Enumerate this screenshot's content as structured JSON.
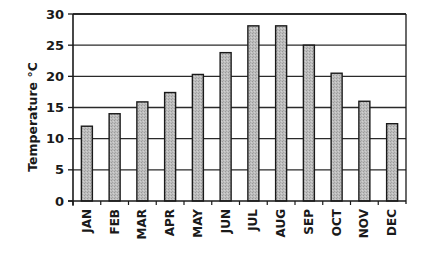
{
  "chart_data": {
    "type": "bar",
    "title": "",
    "xlabel": "",
    "ylabel": "Temperature °C",
    "categories": [
      "JAN",
      "FEB",
      "MAR",
      "APR",
      "MAY",
      "JUN",
      "JUL",
      "AUG",
      "SEP",
      "OCT",
      "NOV",
      "DEC"
    ],
    "values": [
      12.0,
      14.0,
      15.9,
      17.4,
      20.3,
      23.8,
      28.1,
      28.1,
      25.0,
      20.5,
      16.0,
      12.4
    ],
    "ylim": [
      0,
      30
    ],
    "yticks": [
      0,
      5,
      10,
      15,
      20,
      25,
      30
    ],
    "grid": true,
    "legend": null
  },
  "style": {
    "bar_fill": "#b8b8b8",
    "bar_stroke": "#1a1a1a",
    "grid_color": "#2a2a2a",
    "axis_color": "#1a1a1a",
    "background": "#ffffff"
  }
}
